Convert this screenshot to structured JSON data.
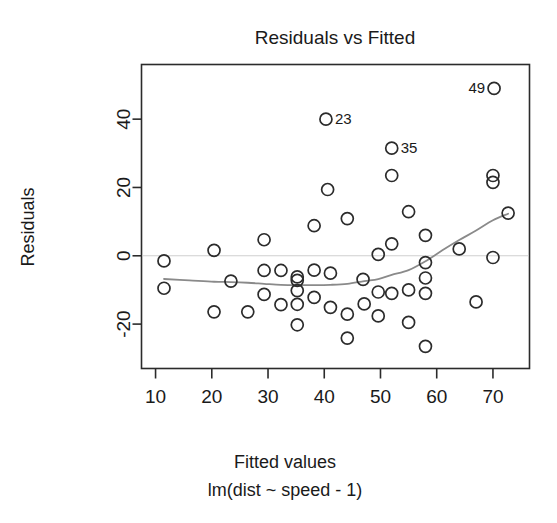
{
  "chart_data": {
    "type": "scatter",
    "title": "Residuals vs Fitted",
    "xlabel": "Fitted values",
    "sublabel": "lm(dist ~ speed - 1)",
    "ylabel": "Residuals",
    "xlim": [
      7.5,
      76.5
    ],
    "ylim": [
      -33,
      56
    ],
    "xticks": [
      10,
      20,
      30,
      40,
      50,
      60,
      70
    ],
    "xticklabels": [
      "10",
      "20",
      "30",
      "40",
      "50",
      "60",
      "70"
    ],
    "yticks": [
      -20,
      0,
      20,
      40
    ],
    "yticklabels": [
      "-20",
      "0",
      "20",
      "40"
    ],
    "grid": false,
    "legend": null,
    "zero_reference_line": 0,
    "marker": "open-circle",
    "marker_radius_px": 6,
    "colors": {
      "point_stroke": "#2b2b2b",
      "smoother": "#8a8a8a",
      "zero_line": "#cfcfcf",
      "frame": "#2b2b2b",
      "text": "#1a1a1a",
      "background": "#ffffff"
    },
    "points": [
      {
        "x": 11.5,
        "y": -9.5
      },
      {
        "x": 11.5,
        "y": -1.5
      },
      {
        "x": 20.4,
        "y": 1.6
      },
      {
        "x": 20.4,
        "y": -16.4
      },
      {
        "x": 23.4,
        "y": -7.4
      },
      {
        "x": 26.4,
        "y": -16.4
      },
      {
        "x": 29.3,
        "y": 4.7
      },
      {
        "x": 29.3,
        "y": -4.3
      },
      {
        "x": 29.3,
        "y": -11.3
      },
      {
        "x": 32.3,
        "y": -4.3
      },
      {
        "x": 32.3,
        "y": -14.3
      },
      {
        "x": 35.2,
        "y": -6.2
      },
      {
        "x": 35.2,
        "y": -10.2
      },
      {
        "x": 35.2,
        "y": -14.2
      },
      {
        "x": 35.2,
        "y": -20.2
      },
      {
        "x": 35.2,
        "y": -7.2
      },
      {
        "x": 38.2,
        "y": 8.8
      },
      {
        "x": 38.2,
        "y": -4.2
      },
      {
        "x": 38.2,
        "y": -12.2
      },
      {
        "x": 40.3,
        "y": 40.0
      },
      {
        "x": 40.6,
        "y": 19.4
      },
      {
        "x": 41.1,
        "y": -5.1
      },
      {
        "x": 41.1,
        "y": -15.1
      },
      {
        "x": 44.1,
        "y": 10.9
      },
      {
        "x": 44.1,
        "y": -17.1
      },
      {
        "x": 44.1,
        "y": -24.1
      },
      {
        "x": 46.9,
        "y": -6.9
      },
      {
        "x": 47.1,
        "y": -14.1
      },
      {
        "x": 49.6,
        "y": 0.4
      },
      {
        "x": 49.6,
        "y": -10.6
      },
      {
        "x": 49.6,
        "y": -17.6
      },
      {
        "x": 52.0,
        "y": 31.5
      },
      {
        "x": 52.0,
        "y": 23.5
      },
      {
        "x": 52.0,
        "y": 3.5
      },
      {
        "x": 52.0,
        "y": -11.0
      },
      {
        "x": 55.0,
        "y": 12.9
      },
      {
        "x": 55.0,
        "y": -10.0
      },
      {
        "x": 55.0,
        "y": -19.5
      },
      {
        "x": 58.0,
        "y": 6.0
      },
      {
        "x": 58.0,
        "y": -2.0
      },
      {
        "x": 58.0,
        "y": -6.5
      },
      {
        "x": 58.0,
        "y": -11.0
      },
      {
        "x": 58.0,
        "y": -26.5
      },
      {
        "x": 64.0,
        "y": 2.0
      },
      {
        "x": 67.0,
        "y": -13.5
      },
      {
        "x": 70.0,
        "y": 23.5
      },
      {
        "x": 70.0,
        "y": 21.5
      },
      {
        "x": 70.0,
        "y": -0.5
      },
      {
        "x": 70.2,
        "y": 49.0
      },
      {
        "x": 72.7,
        "y": 12.5
      }
    ],
    "labeled_points": [
      {
        "label": "23",
        "x": 40.3,
        "y": 40.0,
        "label_side": "right"
      },
      {
        "label": "35",
        "x": 52.0,
        "y": 31.5,
        "label_side": "right"
      },
      {
        "label": "49",
        "x": 70.2,
        "y": 49.0,
        "label_side": "left"
      }
    ],
    "smoother": {
      "name": "lowess",
      "x": [
        11.5,
        16.0,
        20.4,
        23.4,
        26.4,
        29.3,
        32.3,
        35.2,
        38.2,
        41.1,
        44.1,
        47.1,
        49.6,
        52.0,
        55.0,
        58.0,
        61.0,
        64.0,
        67.0,
        70.0,
        72.7
      ],
      "y": [
        -6.8,
        -7.2,
        -7.6,
        -7.7,
        -7.9,
        -8.2,
        -8.5,
        -8.6,
        -8.6,
        -8.5,
        -8.2,
        -7.4,
        -6.8,
        -5.6,
        -4.2,
        -1.6,
        1.6,
        4.6,
        7.4,
        10.4,
        12.3
      ]
    }
  }
}
